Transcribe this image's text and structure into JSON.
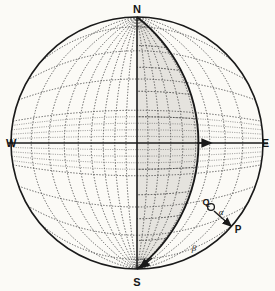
{
  "figure": {
    "kind": "stereographic-projection-net",
    "background_color": "#fbfaf6",
    "ink_color": "#1a1a1a",
    "grid_color": "#555555",
    "shade_color": "#e3e1dc"
  },
  "cardinals": {
    "north": "N",
    "south": "S",
    "east": "E",
    "west": "W"
  },
  "annotations": {
    "point_p": "P",
    "point_q": "Q",
    "angle_alpha": "α",
    "angle_beta": "β"
  },
  "chart_data": {
    "type": "scatter",
    "title": "",
    "xlabel": "",
    "ylabel": "",
    "net": {
      "projection": "equal-angle stereographic (Wulff) net",
      "center_x": 137,
      "center_y": 143,
      "radius": 126,
      "grid_spacing_degrees": 10,
      "primitive_circle": true,
      "grid": true
    },
    "axes": [
      {
        "name": "N-S meridian",
        "from": "N",
        "to": "S",
        "style": "solid"
      },
      {
        "name": "W-E equator",
        "from": "W",
        "to": "E",
        "style": "solid",
        "arrow_at": "E-side great circle intersection"
      }
    ],
    "shaded_region": {
      "name": "eastern hemisphere sector",
      "bounded_by": [
        "N-S meridian",
        "great circle through N and S dipping east"
      ],
      "fill": "#e3e1dc"
    },
    "great_circle": {
      "name": "inclined plane trace",
      "through": [
        "N",
        "S"
      ],
      "dip_direction": "east",
      "style": "solid-bold",
      "arrow_at": "S"
    },
    "points": [
      {
        "label": "Q",
        "x_px": 212,
        "y_px": 209,
        "note": "on great circle trace"
      },
      {
        "label": "P",
        "x_px": 236,
        "y_px": 229,
        "note": "outside primitive, arrow target"
      }
    ],
    "angles": [
      {
        "label": "α",
        "vertex_near": "Q",
        "x_px": 222,
        "y_px": 213
      },
      {
        "label": "β",
        "vertex_near": "great circle near S-E",
        "x_px": 193,
        "y_px": 248
      }
    ],
    "legend": {
      "entries": [],
      "position": "none"
    }
  }
}
